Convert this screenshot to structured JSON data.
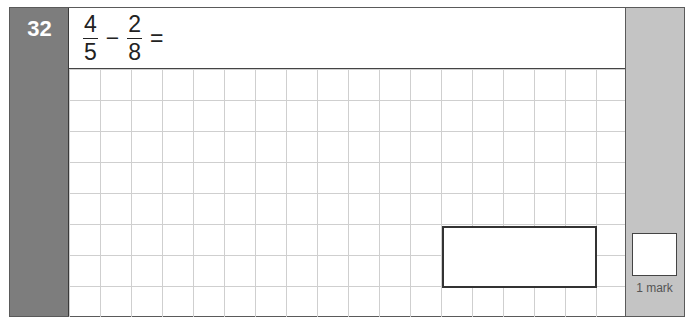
{
  "question": {
    "number": "32",
    "expression": {
      "fraction1": {
        "numerator": "4",
        "denominator": "5"
      },
      "operator": "−",
      "fraction2": {
        "numerator": "2",
        "denominator": "8"
      },
      "equals": "="
    }
  },
  "marks": {
    "label": "1 mark"
  },
  "colors": {
    "left_panel": "#7d7d7d",
    "right_panel": "#c4c4c4",
    "grid_lines": "#cfcfcf"
  }
}
